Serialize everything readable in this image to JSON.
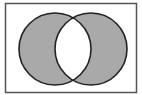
{
  "diagram": {
    "type": "venn",
    "operation": "symmetric-difference",
    "sets": [
      {
        "name": "A",
        "cx": 55,
        "cy": 49,
        "r": 36
      },
      {
        "name": "B",
        "cx": 91,
        "cy": 49,
        "r": 36
      }
    ],
    "universe": {
      "x": 5.5,
      "y": 3.5,
      "width": 131,
      "height": 89
    },
    "colors": {
      "fill": "#a9a9a9",
      "stroke": "#222222",
      "background": "#ffffff",
      "frame": "#555555"
    }
  }
}
